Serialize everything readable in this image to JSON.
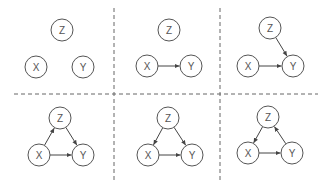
{
  "colors": {
    "background": "#ffffff",
    "node_stroke": "#555555",
    "edge": "#444444",
    "divider": "#666666",
    "label": "#555555"
  },
  "dividers": {
    "vertical": [
      {
        "x": 114,
        "y1": 8,
        "y2": 182
      },
      {
        "x": 220,
        "y1": 8,
        "y2": 182
      }
    ],
    "horizontal": [
      {
        "y": 94,
        "x1": 14,
        "x2": 318
      }
    ]
  },
  "node_radius": 11,
  "panels": [
    {
      "id": "panel-1",
      "nodes": {
        "Z": {
          "label": "Z",
          "x": 62,
          "y": 30
        },
        "X": {
          "label": "X",
          "x": 36,
          "y": 67
        },
        "Y": {
          "label": "Y",
          "x": 83,
          "y": 67
        }
      },
      "edges": []
    },
    {
      "id": "panel-2",
      "nodes": {
        "Z": {
          "label": "Z",
          "x": 169,
          "y": 30
        },
        "X": {
          "label": "X",
          "x": 147,
          "y": 66
        },
        "Y": {
          "label": "Y",
          "x": 191,
          "y": 66
        }
      },
      "edges": [
        [
          "X",
          "Y"
        ]
      ]
    },
    {
      "id": "panel-3",
      "nodes": {
        "Z": {
          "label": "Z",
          "x": 270,
          "y": 28
        },
        "X": {
          "label": "X",
          "x": 248,
          "y": 66
        },
        "Y": {
          "label": "Y",
          "x": 293,
          "y": 66
        }
      },
      "edges": [
        [
          "X",
          "Y"
        ],
        [
          "Z",
          "Y"
        ]
      ]
    },
    {
      "id": "panel-4",
      "nodes": {
        "Z": {
          "label": "Z",
          "x": 60,
          "y": 118
        },
        "X": {
          "label": "X",
          "x": 39,
          "y": 155
        },
        "Y": {
          "label": "Y",
          "x": 83,
          "y": 155
        }
      },
      "edges": [
        [
          "X",
          "Y"
        ],
        [
          "X",
          "Z"
        ],
        [
          "Z",
          "Y"
        ]
      ]
    },
    {
      "id": "panel-5",
      "nodes": {
        "Z": {
          "label": "Z",
          "x": 168,
          "y": 118
        },
        "X": {
          "label": "X",
          "x": 148,
          "y": 155
        },
        "Y": {
          "label": "Y",
          "x": 192,
          "y": 155
        }
      },
      "edges": [
        [
          "X",
          "Y"
        ],
        [
          "Z",
          "X"
        ],
        [
          "Z",
          "Y"
        ]
      ]
    },
    {
      "id": "panel-6",
      "nodes": {
        "Z": {
          "label": "Z",
          "x": 268,
          "y": 117
        },
        "X": {
          "label": "X",
          "x": 248,
          "y": 153
        },
        "Y": {
          "label": "Y",
          "x": 292,
          "y": 153
        }
      },
      "edges": [
        [
          "X",
          "Y"
        ],
        [
          "Z",
          "X"
        ],
        [
          "Y",
          "Z"
        ]
      ]
    }
  ]
}
